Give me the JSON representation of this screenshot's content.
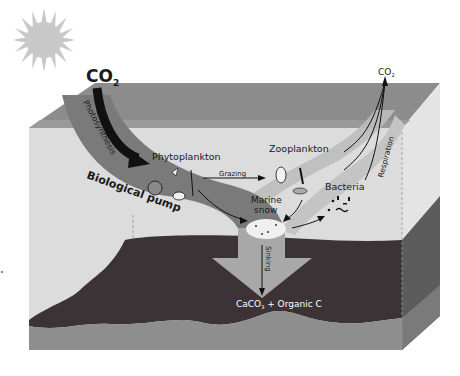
{
  "title": "Biological pump",
  "labels": {
    "co2_in": "CO",
    "co2_in_sub": "2",
    "co2_out": "CO",
    "co2_out_sub": "2",
    "photosynthesis": "Photosynthesis",
    "biological_pump": "Biological pump",
    "phytoplankton": "Phytoplankton",
    "grazing": "Grazing",
    "zooplankton": "Zooplankton",
    "bacteria": "Bacteria",
    "respiration": "Respiration",
    "marine_snow_line1": "Marine",
    "marine_snow_line2": "snow",
    "sinking": "Sinking",
    "sediment_a": "CaCO",
    "sediment_sub": "3",
    "sediment_b": " + Organic C"
  },
  "colors": {
    "sun": "#c8c8c8",
    "ocean_surface": "#8c8c8c",
    "water_front": "#d9d9d9",
    "water_side": "#e4e4e4",
    "pump_band": "#7a7a7a",
    "respiration_band": "#b5b5b5",
    "seafloor": "#3b3335",
    "sediment_base": "#8e8e8e",
    "arrow_dark": "#111111",
    "sinking_arrow": "#a8a8a8"
  }
}
